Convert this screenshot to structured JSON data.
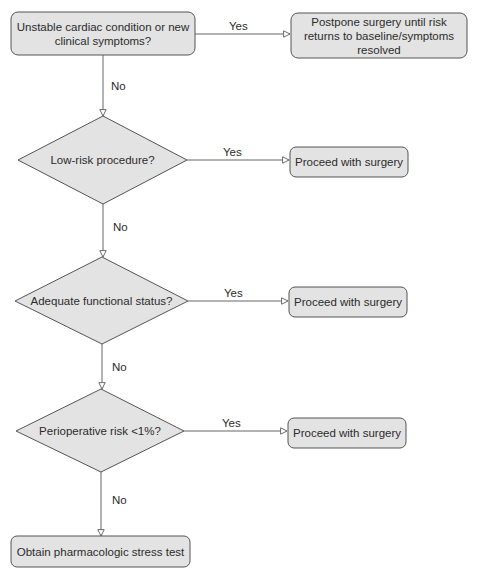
{
  "colors": {
    "node_fill": "#e3e3e3",
    "node_stroke": "#555555",
    "edge_stroke": "#666666",
    "background": "#ffffff"
  },
  "nodes": {
    "start": {
      "shape": "rounded-rect",
      "text": "Unstable cardiac condition or new clinical symptoms?"
    },
    "postpone": {
      "shape": "rounded-rect",
      "text": "Postpone surgery until risk returns to baseline/symptoms resolved"
    },
    "low_risk": {
      "shape": "diamond",
      "text": "Low-risk procedure?"
    },
    "proceed1": {
      "shape": "rounded-rect",
      "text": "Proceed with surgery"
    },
    "functional": {
      "shape": "diamond",
      "text": "Adequate functional status?"
    },
    "proceed2": {
      "shape": "rounded-rect",
      "text": "Proceed with surgery"
    },
    "periop": {
      "shape": "diamond",
      "text": "Perioperative risk <1%?"
    },
    "proceed3": {
      "shape": "rounded-rect",
      "text": "Proceed with surgery"
    },
    "stress_test": {
      "shape": "rounded-rect",
      "text": "Obtain pharmacologic stress test"
    }
  },
  "edges": [
    {
      "from": "start",
      "to": "postpone",
      "label": "Yes"
    },
    {
      "from": "start",
      "to": "low_risk",
      "label": "No"
    },
    {
      "from": "low_risk",
      "to": "proceed1",
      "label": "Yes"
    },
    {
      "from": "low_risk",
      "to": "functional",
      "label": "No"
    },
    {
      "from": "functional",
      "to": "proceed2",
      "label": "Yes"
    },
    {
      "from": "functional",
      "to": "periop",
      "label": "No"
    },
    {
      "from": "periop",
      "to": "proceed3",
      "label": "Yes"
    },
    {
      "from": "periop",
      "to": "stress_test",
      "label": "No"
    }
  ]
}
